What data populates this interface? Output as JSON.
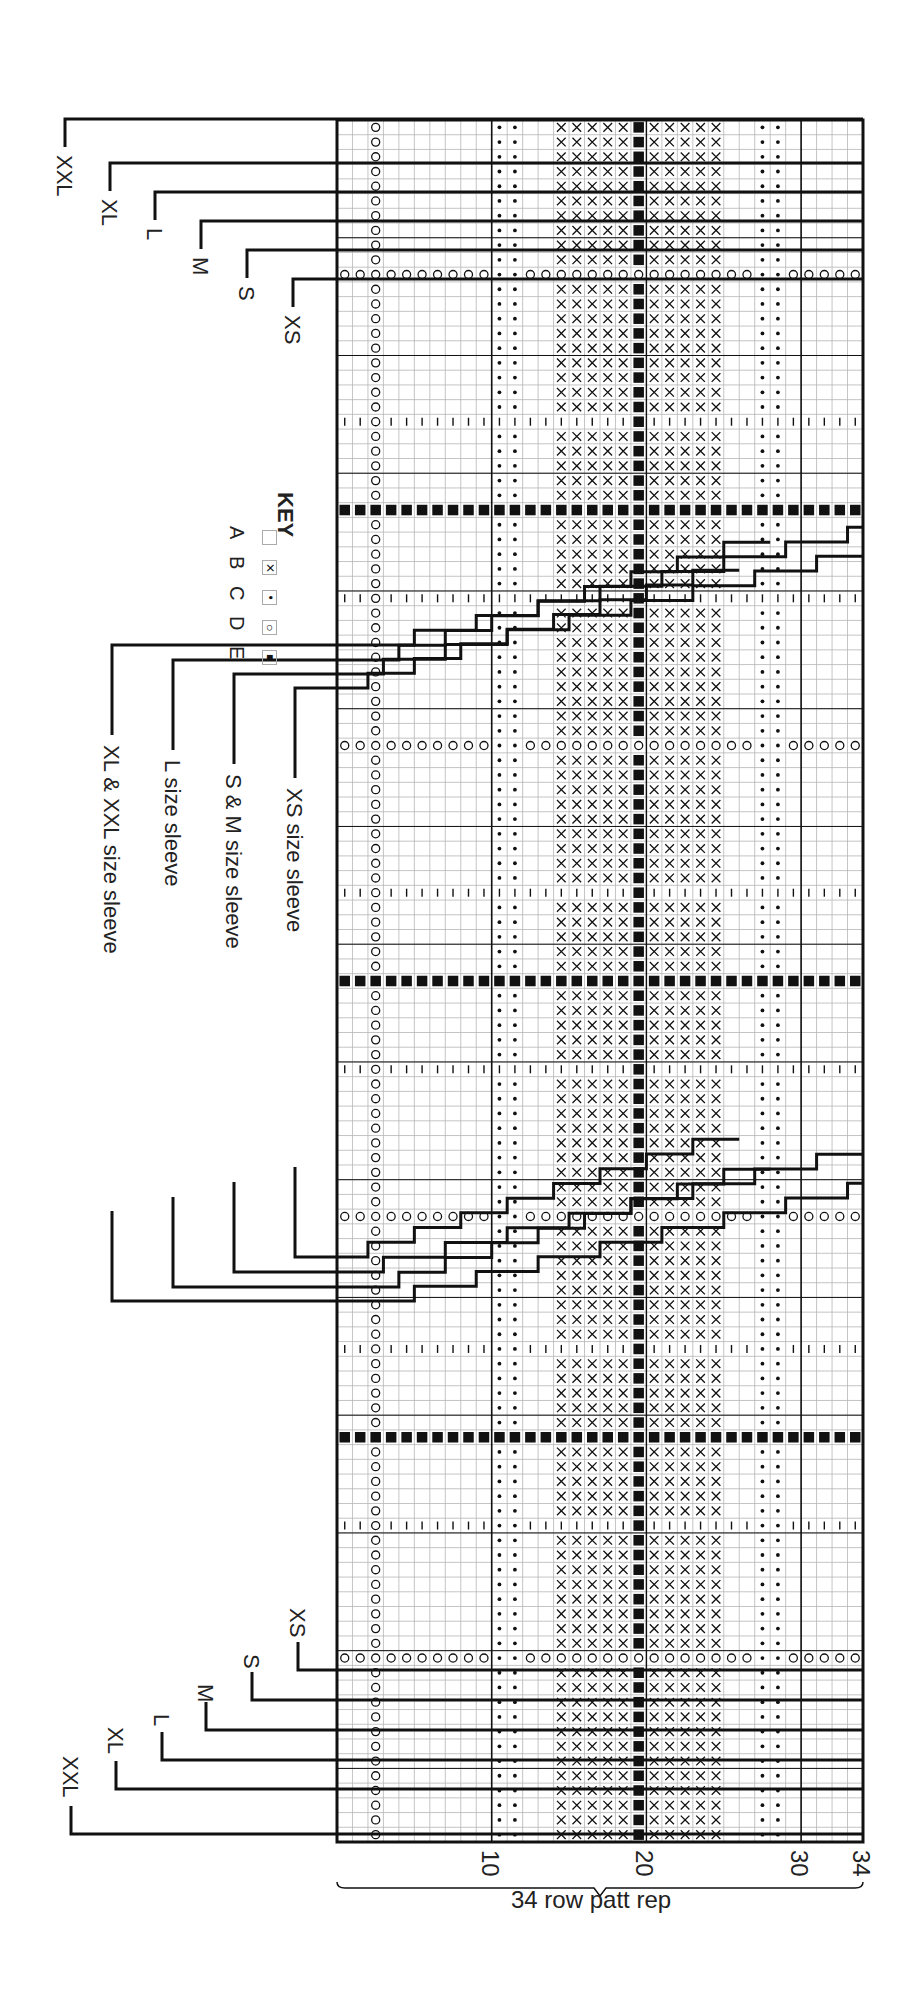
{
  "chart": {
    "grid": {
      "left": 337,
      "top": 120,
      "right": 863,
      "bottom": 1842,
      "columns": 34,
      "rows": 117
    },
    "column_symbols": {
      "D_column": [
        3
      ],
      "C_columns": [
        11,
        12,
        28,
        29
      ],
      "B_columns": [
        15,
        16,
        17,
        18,
        19,
        21,
        22,
        23,
        24,
        25
      ],
      "E_column": [
        20
      ]
    },
    "special_rows": {
      "D_rows": [
        10,
        42,
        74,
        104
      ],
      "tick_rows": [
        20,
        32,
        52,
        64,
        83,
        95
      ],
      "E_rows": [
        26,
        58,
        89
      ]
    },
    "thick_vertical_columns": [
      10,
      30
    ],
    "thin_vertical_column": 20,
    "colors": {
      "ink": "#111111",
      "grid": "#b5b5b5",
      "background": "#ffffff"
    }
  },
  "key": {
    "title": "KEY",
    "items": [
      {
        "symbol": "empty-square",
        "label": "A"
      },
      {
        "symbol": "cross",
        "label": "B"
      },
      {
        "symbol": "dot",
        "label": "C"
      },
      {
        "symbol": "circle",
        "label": "D"
      },
      {
        "symbol": "filled-square",
        "label": "E"
      }
    ]
  },
  "size_labels_top": [
    {
      "label": "XXL",
      "x": 65,
      "y": 119
    },
    {
      "label": "XL",
      "x": 110,
      "y": 163
    },
    {
      "label": "L",
      "x": 155,
      "y": 192
    },
    {
      "label": "M",
      "x": 201,
      "y": 221
    },
    {
      "label": "S",
      "x": 247,
      "y": 250
    },
    {
      "label": "XS",
      "x": 293,
      "y": 279
    }
  ],
  "size_labels_bottom": [
    {
      "label": "XS",
      "x": 298,
      "y": 1670
    },
    {
      "label": "S",
      "x": 252,
      "y": 1700
    },
    {
      "label": "M",
      "x": 206,
      "y": 1730
    },
    {
      "label": "L",
      "x": 162,
      "y": 1760
    },
    {
      "label": "XL",
      "x": 116,
      "y": 1789
    },
    {
      "label": "XXL",
      "x": 71,
      "y": 1834
    }
  ],
  "sleeve_labels": [
    {
      "label": "XS size sleeve",
      "x": 295,
      "y_top": 688,
      "y_bottom": 1257
    },
    {
      "label": "S & M size sleeve",
      "x": 234,
      "y_top": 674,
      "y_bottom": 1272
    },
    {
      "label": "L size sleeve",
      "x": 173,
      "y_top": 660,
      "y_bottom": 1287
    },
    {
      "label": "XL & XXL size sleeve",
      "x": 112,
      "y_top": 645,
      "y_bottom": 1301
    }
  ],
  "row_numbers": [
    {
      "label": "10",
      "row": 10
    },
    {
      "label": "20",
      "row": 20
    },
    {
      "label": "30",
      "row": 30
    },
    {
      "label": "34",
      "row": 34
    }
  ],
  "repeat_label": "34 row patt rep"
}
